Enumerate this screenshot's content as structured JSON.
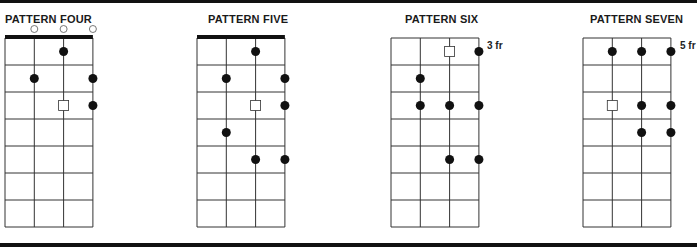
{
  "diagrams": [
    {
      "title": "PATTERN FOUR",
      "title_x": 5,
      "grid_left": 5,
      "nut": true,
      "open_strings": [
        2,
        3,
        4
      ],
      "fret_label": "",
      "notes": [
        {
          "string": 3,
          "fret": 1,
          "type": "dot"
        },
        {
          "string": 2,
          "fret": 2,
          "type": "dot"
        },
        {
          "string": 4,
          "fret": 2,
          "type": "dot"
        },
        {
          "string": 3,
          "fret": 3,
          "type": "root"
        },
        {
          "string": 4,
          "fret": 3,
          "type": "dot"
        }
      ]
    },
    {
      "title": "PATTERN FIVE",
      "title_x": 208,
      "grid_left": 197,
      "nut": true,
      "open_strings": [],
      "fret_label": "",
      "notes": [
        {
          "string": 3,
          "fret": 1,
          "type": "dot"
        },
        {
          "string": 2,
          "fret": 2,
          "type": "dot"
        },
        {
          "string": 4,
          "fret": 2,
          "type": "dot"
        },
        {
          "string": 3,
          "fret": 3,
          "type": "root"
        },
        {
          "string": 4,
          "fret": 3,
          "type": "dot"
        },
        {
          "string": 2,
          "fret": 4,
          "type": "dot"
        },
        {
          "string": 3,
          "fret": 5,
          "type": "dot"
        },
        {
          "string": 4,
          "fret": 5,
          "type": "dot"
        }
      ]
    },
    {
      "title": "PATTERN SIX",
      "title_x": 405,
      "grid_left": 391,
      "nut": false,
      "open_strings": [],
      "fret_label": "3 fr",
      "notes": [
        {
          "string": 3,
          "fret": 1,
          "type": "root"
        },
        {
          "string": 4,
          "fret": 1,
          "type": "dot"
        },
        {
          "string": 2,
          "fret": 2,
          "type": "dot"
        },
        {
          "string": 2,
          "fret": 3,
          "type": "dot"
        },
        {
          "string": 3,
          "fret": 3,
          "type": "dot"
        },
        {
          "string": 4,
          "fret": 3,
          "type": "dot"
        },
        {
          "string": 3,
          "fret": 5,
          "type": "dot"
        },
        {
          "string": 4,
          "fret": 5,
          "type": "dot"
        }
      ]
    },
    {
      "title": "PATTERN SEVEN",
      "title_x": 590,
      "grid_left": 583,
      "nut": false,
      "open_strings": [],
      "fret_label": "5 fr",
      "notes": [
        {
          "string": 2,
          "fret": 1,
          "type": "dot"
        },
        {
          "string": 3,
          "fret": 1,
          "type": "dot"
        },
        {
          "string": 4,
          "fret": 1,
          "type": "dot"
        },
        {
          "string": 2,
          "fret": 3,
          "type": "root"
        },
        {
          "string": 3,
          "fret": 3,
          "type": "dot"
        },
        {
          "string": 4,
          "fret": 3,
          "type": "dot"
        },
        {
          "string": 3,
          "fret": 4,
          "type": "dot"
        },
        {
          "string": 4,
          "fret": 4,
          "type": "dot"
        }
      ]
    }
  ],
  "grid": {
    "strings": 4,
    "frets": 7,
    "string_spacing": 29.3,
    "fret_spacing": 27,
    "top": 38
  },
  "colors": {
    "line": "#333333",
    "dot": "#111111",
    "root_fill": "#ffffff",
    "border": "#111111"
  }
}
